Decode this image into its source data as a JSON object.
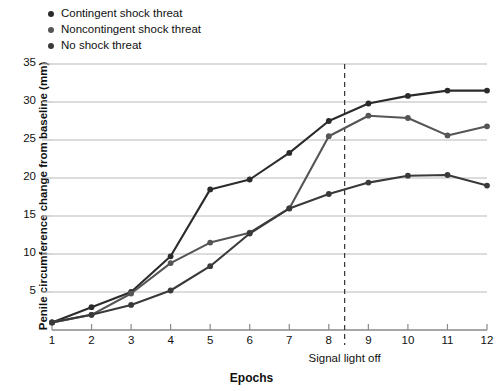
{
  "legend": {
    "position": "top-left",
    "items": [
      {
        "label": "Contingent shock threat",
        "color": "#2b2b2b",
        "marker": "legend-dot-icon"
      },
      {
        "label": "Noncontingent shock threat",
        "color": "#555555",
        "marker": "legend-dot-icon"
      },
      {
        "label": "No shock threat",
        "color": "#3a3a3a",
        "marker": "legend-dot-icon"
      }
    ]
  },
  "axes": {
    "ylabel": "Penile circumference change from baseline (mm)",
    "xlabel": "Epochs",
    "yticks": [
      5,
      10,
      15,
      20,
      25,
      30,
      35
    ],
    "xticks": [
      1,
      2,
      3,
      4,
      5,
      6,
      7,
      8,
      9,
      10,
      11,
      12
    ]
  },
  "annotation": {
    "label": "Signal light off",
    "x_value": 8.4,
    "style": "dashed-vertical-line"
  },
  "chart_data": {
    "type": "line",
    "title": "",
    "xlabel": "Epochs",
    "ylabel": "Penile circumference change from baseline (mm)",
    "x": [
      1,
      2,
      3,
      4,
      5,
      6,
      7,
      8,
      9,
      10,
      11,
      12
    ],
    "xlim": [
      1,
      12
    ],
    "ylim": [
      0,
      35
    ],
    "yticks": [
      5,
      10,
      15,
      20,
      25,
      30,
      35
    ],
    "grid": "horizontal",
    "legend_position": "top-left",
    "annotations": [
      {
        "text": "Signal light off",
        "x": 8.4,
        "type": "vline-dashed"
      }
    ],
    "series": [
      {
        "name": "Contingent shock threat",
        "color": "#2b2b2b",
        "values": [
          1.0,
          3.0,
          5.0,
          9.7,
          18.5,
          19.8,
          23.3,
          27.5,
          29.8,
          30.8,
          31.5,
          31.5
        ]
      },
      {
        "name": "Noncontingent shock threat",
        "color": "#555555",
        "values": [
          1.0,
          2.0,
          4.8,
          8.8,
          11.5,
          12.8,
          16.0,
          25.5,
          28.2,
          27.9,
          25.6,
          26.8
        ]
      },
      {
        "name": "No shock threat",
        "color": "#3a3a3a",
        "values": [
          1.0,
          2.0,
          3.3,
          5.2,
          8.4,
          12.7,
          16.0,
          17.9,
          19.4,
          20.3,
          20.4,
          19.0
        ]
      }
    ]
  }
}
